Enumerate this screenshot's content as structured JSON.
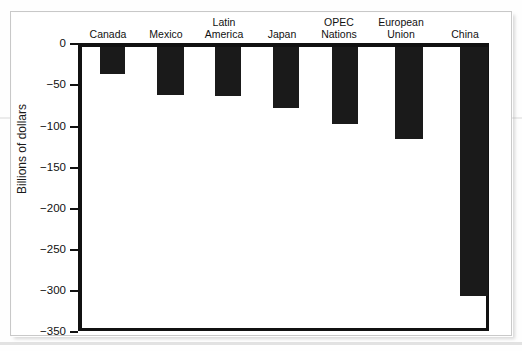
{
  "figure": {
    "background_color": "#ffffff",
    "frame_color": "#c9c9c9",
    "axis_color": "#111111",
    "bar_color": "#1a1a1a"
  },
  "chart_data": {
    "type": "bar",
    "title": "",
    "subtitle": "",
    "xlabel": "",
    "ylabel": "Billions of dollars",
    "categories": [
      "Canada",
      "Mexico",
      "Latin\nAmerica",
      "Japan",
      "OPEC\nNations",
      "European\nUnion",
      "China"
    ],
    "values": [
      -34,
      -60,
      -61,
      -76,
      -96,
      -114,
      -310
    ],
    "ylim": [
      -350,
      0
    ],
    "yticks": [
      0,
      -50,
      -100,
      -150,
      -200,
      -250,
      -300,
      -350
    ],
    "ytick_labels": [
      "0",
      "−50",
      "−100",
      "−150",
      "−200",
      "−250",
      "−300",
      "−350"
    ],
    "grid": false,
    "legend": null,
    "orientation": "vertical",
    "category_label_position": "above-zero-line"
  }
}
